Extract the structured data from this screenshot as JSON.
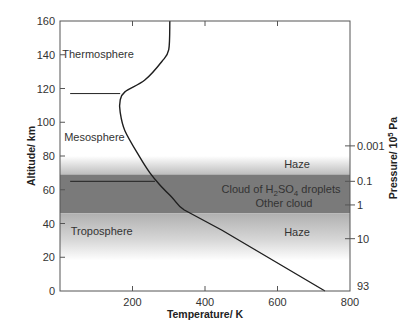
{
  "chart_data": {
    "type": "line",
    "title": "",
    "xlabel": "Temperature/ K",
    "ylabel": "Altitude/ km",
    "y2label": "Pressure/ 10^5 Pa",
    "y2label_parts": {
      "prefix": "Pressure/ 10",
      "sup": "5",
      "suffix": " Pa"
    },
    "xlim": [
      0,
      800
    ],
    "ylim": [
      0,
      160
    ],
    "xticks": [
      200,
      400,
      600,
      800
    ],
    "xtick_labels": [
      "200",
      "400",
      "600",
      "800"
    ],
    "yticks": [
      0,
      20,
      40,
      60,
      80,
      100,
      120,
      140,
      160
    ],
    "ytick_labels": [
      "0",
      "20",
      "40",
      "60",
      "80",
      "100",
      "120",
      "140",
      "160"
    ],
    "y2ticks": [
      {
        "altitude": 86,
        "label": "0.001"
      },
      {
        "altitude": 65,
        "label": "0.1"
      },
      {
        "altitude": 51,
        "label": "1"
      },
      {
        "altitude": 31,
        "label": "10"
      },
      {
        "altitude": 0,
        "label": "93"
      }
    ],
    "grid": false,
    "series": [
      {
        "name": "Temperature profile",
        "x": [
          303,
          300,
          281,
          234,
          179,
          166,
          166,
          179,
          221,
          248,
          275,
          311,
          343,
          447,
          731
        ],
        "y": [
          160,
          143,
          136,
          125,
          118,
          113,
          106,
          95,
          79,
          70,
          63,
          55,
          48,
          36,
          0
        ]
      }
    ],
    "reference_lines": [
      {
        "name": "upper-boundary",
        "altitude": 117,
        "x_start": 28,
        "x_end": 166
      },
      {
        "name": "cloud-top-marker",
        "altitude": 65,
        "x_start": 28,
        "x_end": 262
      }
    ],
    "bands": [
      {
        "name": "upper-haze",
        "label": "Haze",
        "from": 69,
        "to": 80,
        "style": "gradient"
      },
      {
        "name": "cloud-layer",
        "label_line1_parts": {
          "prefix": "Cloud of H",
          "sub1": "2",
          "mid": "SO",
          "sub2": "4",
          "suffix": " droplets"
        },
        "label_line2": "Other cloud",
        "from": 46,
        "to": 69,
        "style": "dark"
      },
      {
        "name": "lower-haze",
        "label": "Haze",
        "from": 18,
        "to": 46,
        "style": "gradient"
      }
    ],
    "region_labels": [
      {
        "text": "Thermosphere",
        "x": 105,
        "y": 138
      },
      {
        "text": "Mesosphere",
        "x": 95,
        "y": 89
      },
      {
        "text": "Troposphere",
        "x": 115,
        "y": 33
      }
    ]
  }
}
